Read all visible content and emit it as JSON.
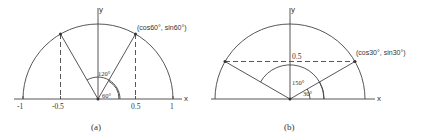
{
  "figures": [
    {
      "id": "a",
      "caption": "(a)",
      "x_axis_label": "x",
      "y_axis_label": "y",
      "tick_labels": [
        "-1",
        "-0.5",
        "0.5",
        "1"
      ],
      "point_label": "(cos60°, sin60°)",
      "angle_labels": [
        "120°",
        "60°"
      ],
      "angles_deg": [
        60,
        120
      ]
    },
    {
      "id": "b",
      "caption": "(b)",
      "x_axis_label": "x",
      "y_axis_label": "y",
      "tick_labels": [
        "0.5"
      ],
      "point_label": "(cos30°, sin30°)",
      "angle_labels": [
        "150°",
        "30°"
      ],
      "angles_deg": [
        30,
        150
      ]
    }
  ],
  "colors": {
    "stroke": "#444444",
    "text": "#333333"
  }
}
